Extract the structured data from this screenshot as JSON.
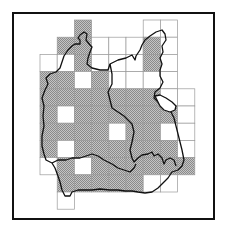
{
  "map": {
    "type": "grid distribution map",
    "frame": {
      "x": 13,
      "y": 13,
      "w": 201,
      "h": 206
    },
    "grid": {
      "origin_x": 40,
      "origin_y": 20,
      "cell": 17.2
    },
    "colors": {
      "frame": "#111111",
      "grid": "#9a9a9a",
      "shade": "#a9a9a9",
      "outline": "#111111"
    },
    "legend": {
      "shaded": "recorded",
      "white": "not recorded"
    },
    "cells": [
      {
        "r": 0,
        "c": 2,
        "s": 1
      },
      {
        "r": 0,
        "c": 6,
        "s": 0
      },
      {
        "r": 0,
        "c": 7,
        "s": 0
      },
      {
        "r": 1,
        "c": 1,
        "s": 1
      },
      {
        "r": 1,
        "c": 2,
        "s": 1
      },
      {
        "r": 1,
        "c": 3,
        "s": 0
      },
      {
        "r": 1,
        "c": 4,
        "s": 0
      },
      {
        "r": 1,
        "c": 5,
        "s": 0
      },
      {
        "r": 1,
        "c": 6,
        "s": 1
      },
      {
        "r": 1,
        "c": 7,
        "s": 0
      },
      {
        "r": 2,
        "c": 0,
        "s": 0
      },
      {
        "r": 2,
        "c": 1,
        "s": 0
      },
      {
        "r": 2,
        "c": 2,
        "s": 1
      },
      {
        "r": 2,
        "c": 3,
        "s": 0
      },
      {
        "r": 2,
        "c": 4,
        "s": 0
      },
      {
        "r": 2,
        "c": 5,
        "s": 0
      },
      {
        "r": 2,
        "c": 6,
        "s": 1
      },
      {
        "r": 2,
        "c": 7,
        "s": 0
      },
      {
        "r": 3,
        "c": 0,
        "s": 1
      },
      {
        "r": 3,
        "c": 1,
        "s": 1
      },
      {
        "r": 3,
        "c": 2,
        "s": 0
      },
      {
        "r": 3,
        "c": 3,
        "s": 1
      },
      {
        "r": 3,
        "c": 4,
        "s": 0
      },
      {
        "r": 3,
        "c": 5,
        "s": 0
      },
      {
        "r": 3,
        "c": 6,
        "s": 0
      },
      {
        "r": 3,
        "c": 7,
        "s": 0
      },
      {
        "r": 4,
        "c": 0,
        "s": 1
      },
      {
        "r": 4,
        "c": 1,
        "s": 1
      },
      {
        "r": 4,
        "c": 2,
        "s": 1
      },
      {
        "r": 4,
        "c": 3,
        "s": 1
      },
      {
        "r": 4,
        "c": 4,
        "s": 1
      },
      {
        "r": 4,
        "c": 5,
        "s": 1
      },
      {
        "r": 4,
        "c": 6,
        "s": 1
      },
      {
        "r": 4,
        "c": 7,
        "s": 0
      },
      {
        "r": 4,
        "c": 8,
        "s": 0
      },
      {
        "r": 5,
        "c": 0,
        "s": 1
      },
      {
        "r": 5,
        "c": 1,
        "s": 0
      },
      {
        "r": 5,
        "c": 2,
        "s": 1
      },
      {
        "r": 5,
        "c": 3,
        "s": 1
      },
      {
        "r": 5,
        "c": 4,
        "s": 1
      },
      {
        "r": 5,
        "c": 5,
        "s": 1
      },
      {
        "r": 5,
        "c": 6,
        "s": 1
      },
      {
        "r": 5,
        "c": 7,
        "s": 1
      },
      {
        "r": 5,
        "c": 8,
        "s": 0
      },
      {
        "r": 6,
        "c": 0,
        "s": 1
      },
      {
        "r": 6,
        "c": 1,
        "s": 1
      },
      {
        "r": 6,
        "c": 2,
        "s": 1
      },
      {
        "r": 6,
        "c": 3,
        "s": 1
      },
      {
        "r": 6,
        "c": 4,
        "s": 0
      },
      {
        "r": 6,
        "c": 5,
        "s": 1
      },
      {
        "r": 6,
        "c": 6,
        "s": 1
      },
      {
        "r": 6,
        "c": 7,
        "s": 0
      },
      {
        "r": 6,
        "c": 8,
        "s": 0
      },
      {
        "r": 7,
        "c": 0,
        "s": 1
      },
      {
        "r": 7,
        "c": 1,
        "s": 0
      },
      {
        "r": 7,
        "c": 2,
        "s": 1
      },
      {
        "r": 7,
        "c": 3,
        "s": 1
      },
      {
        "r": 7,
        "c": 4,
        "s": 1
      },
      {
        "r": 7,
        "c": 5,
        "s": 1
      },
      {
        "r": 7,
        "c": 6,
        "s": 1
      },
      {
        "r": 7,
        "c": 7,
        "s": 1
      },
      {
        "r": 7,
        "c": 8,
        "s": 0
      },
      {
        "r": 8,
        "c": 0,
        "s": 0
      },
      {
        "r": 8,
        "c": 1,
        "s": 1
      },
      {
        "r": 8,
        "c": 2,
        "s": 0
      },
      {
        "r": 8,
        "c": 3,
        "s": 1
      },
      {
        "r": 8,
        "c": 4,
        "s": 1
      },
      {
        "r": 8,
        "c": 5,
        "s": 1
      },
      {
        "r": 8,
        "c": 6,
        "s": 1
      },
      {
        "r": 8,
        "c": 7,
        "s": 1
      },
      {
        "r": 8,
        "c": 8,
        "s": 1
      },
      {
        "r": 9,
        "c": 1,
        "s": 1
      },
      {
        "r": 9,
        "c": 2,
        "s": 1
      },
      {
        "r": 9,
        "c": 3,
        "s": 1
      },
      {
        "r": 9,
        "c": 4,
        "s": 1
      },
      {
        "r": 9,
        "c": 5,
        "s": 1
      },
      {
        "r": 9,
        "c": 6,
        "s": 0
      },
      {
        "r": 9,
        "c": 7,
        "s": 0
      },
      {
        "r": 10,
        "c": 1,
        "s": 0
      }
    ],
    "outlines": [
      {
        "name": "outer-county-boundary",
        "d": "M84,32 L87,34 L86,40 L90,45 L92,47 L90,52 L88,58 L87,64 L92,68 L100,70 L108,70 L110,64 L118,60 L126,58 L132,55 L135,60 L136,56 L140,50 L142,45 L145,40 L150,36 L156,32 L162,30 L165,34 L166,40 L162,46 L163,52 L160,58 L162,64 L160,70 L160,76 L163,82 L160,88 L155,92 L154,98 L158,102 L162,106 L170,110 L174,118 L176,126 L178,134 L180,142 L182,150 L184,160 L182,166 L178,170 L172,172 L168,178 L162,184 L158,188 L152,192 L145,193 L138,192 L132,191 L125,191 L118,190 L110,190 L100,189 L92,190 L85,190 L78,190 L72,192 L70,196 L65,196 L62,190 L60,182 L58,176 L55,168 L52,163 L46,160 L44,154 L42,146 L42,136 L44,126 L43,116 L44,106 L42,98 L45,90 L48,84 L46,78 L50,74 L56,72 L60,68 L62,62 L64,56 L68,50 L72,46 L75,44 L80,44 L80,40 L78,38 L80,35 Z"
      },
      {
        "name": "inner-boundary-east",
        "d": "M110,64 L112,74 L112,84 L108,92 L110,100 L112,108 L118,112 L124,116 L128,120 L132,124 L134,132 L132,142 L130,150 L132,158 L134,162 L138,158 L142,155 L148,154 L152,152 L154,156 L158,154 L162,158 L164,164 L166,160 L170,158 L174,160 L176,166"
      },
      {
        "name": "inner-boundary-south",
        "d": "M52,163 L58,160 L66,160 L72,158 L80,158 L86,156 L92,154 L98,156 L104,160 L108,162 L112,164 L118,168 L124,170 L130,172 L134,168 L136,164"
      },
      {
        "name": "lake",
        "d": "M155,96 L160,95 L166,98 L172,102 L176,106 L175,110 L170,112 L164,110 L160,106 L157,100 Z"
      }
    ]
  }
}
